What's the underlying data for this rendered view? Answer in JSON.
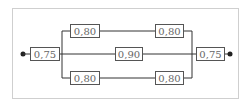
{
  "diagram": {
    "type": "reliability-block-diagram",
    "input_block": {
      "label": "0,75"
    },
    "output_block": {
      "label": "0,75"
    },
    "branches": [
      {
        "name": "top",
        "blocks": [
          {
            "label": "0,80"
          },
          {
            "label": "0,80"
          }
        ]
      },
      {
        "name": "middle",
        "blocks": [
          {
            "label": "0,90"
          }
        ]
      },
      {
        "name": "bottom",
        "blocks": [
          {
            "label": "0,80"
          },
          {
            "label": "0,80"
          }
        ]
      }
    ],
    "colors": {
      "line": "#333333",
      "box_border": "#555555",
      "text": "#666666",
      "frame": "#cfcfcf"
    }
  }
}
